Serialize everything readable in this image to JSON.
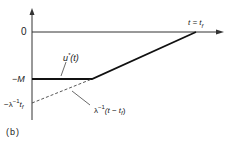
{
  "figure": {
    "panel_label": "(b)",
    "axis_origin_label": "0",
    "time_end_label": "t = t",
    "time_end_sub": "f",
    "level_minus_M": "−M",
    "level_lambda_prefix": "−λ",
    "level_lambda_sup": "−1",
    "level_lambda_var": "t",
    "level_lambda_sub": "f",
    "control_label": "u",
    "control_sup": "*",
    "control_arg": "(t)",
    "costate_prefix": "λ",
    "costate_sup": "−1",
    "costate_arg_open": "(t − t",
    "costate_arg_sub": "f",
    "costate_arg_close": ")"
  },
  "colors": {
    "ink": "#222222",
    "background": "#ffffff"
  }
}
